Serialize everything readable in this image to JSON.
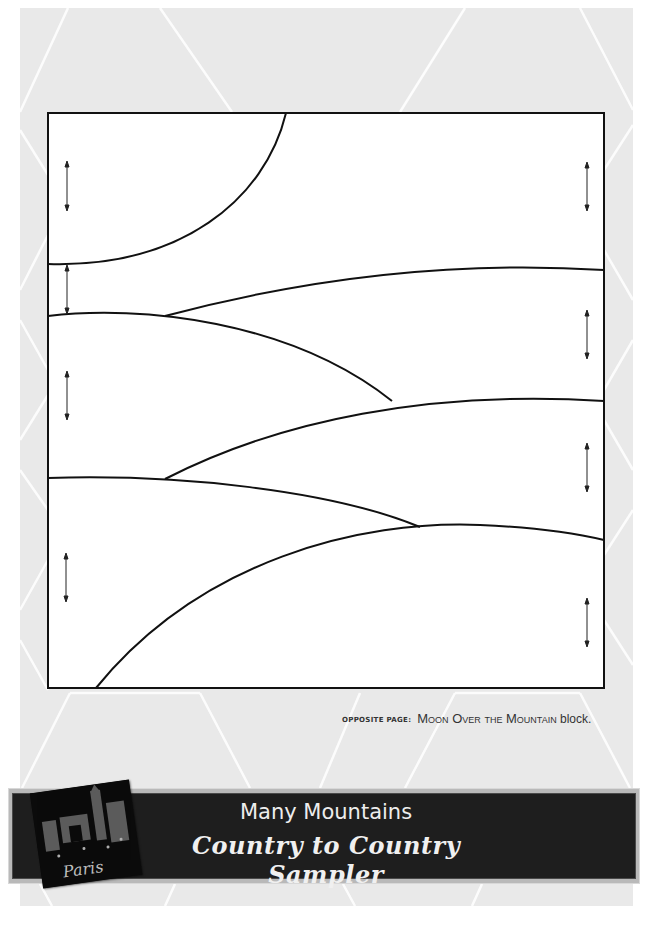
{
  "page": {
    "background_color": "#e9e9e9",
    "pattern_line_color": "#ffffff"
  },
  "block_diagram": {
    "name": "Moon Over the Mountain",
    "outline_color": "#111111",
    "grain_arrow_count": 8
  },
  "caption": {
    "lead": "Opposite page:",
    "title": "Moon Over the Mountain",
    "suffix": " block."
  },
  "banner": {
    "title": "Many Mountains",
    "subtitle": "Country to Country Sampler",
    "background_color": "#1e1e1e",
    "text_color": "#eeeeee",
    "photo": {
      "description": "Paris street scene with Arc de Triomphe",
      "handwritten_text": "Paris"
    }
  }
}
